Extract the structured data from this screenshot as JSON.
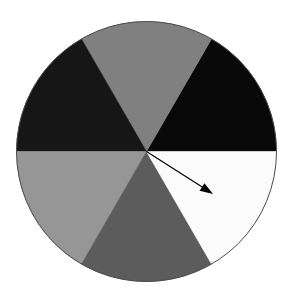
{
  "figure": {
    "background_color": "#ffffff",
    "width": 289,
    "height": 290
  },
  "wheel": {
    "name": "spinner-wheel",
    "center_x": 146.5,
    "center_y": 151.5,
    "radius": 130,
    "outline_color": "#4a4a4a",
    "outline_width": 1,
    "sector_count": 6,
    "sector_angle_degrees": 60
  },
  "chart_data": {
    "type": "pie",
    "categories": [
      "upper-right-black",
      "top-gray",
      "upper-left-dark",
      "lower-left-light-gray",
      "bottom-dark-gray",
      "lower-right-white"
    ],
    "values": [
      60,
      60,
      60,
      60,
      60,
      60
    ],
    "value_unit": "degrees",
    "colors": [
      "#090909",
      "#808080",
      "#161616",
      "#969696",
      "#5c5c5c",
      "#fbfbfb"
    ],
    "start_angle_degrees": 0,
    "legend": "none",
    "xlabel": "",
    "ylabel": ""
  },
  "sectors": [
    {
      "id": "sector-upper-right",
      "label": "upper-right-black",
      "color": "#090909",
      "start_angle": 0,
      "end_angle": 60
    },
    {
      "id": "sector-top",
      "label": "top-gray",
      "color": "#808080",
      "start_angle": 60,
      "end_angle": 120
    },
    {
      "id": "sector-upper-left",
      "label": "upper-left-dark",
      "color": "#161616",
      "start_angle": 120,
      "end_angle": 180
    },
    {
      "id": "sector-lower-left",
      "label": "lower-left-light-gray",
      "color": "#969696",
      "start_angle": 180,
      "end_angle": 240
    },
    {
      "id": "sector-bottom",
      "label": "bottom-dark-gray",
      "color": "#5c5c5c",
      "start_angle": 240,
      "end_angle": 300
    },
    {
      "id": "sector-lower-right",
      "label": "lower-right-white",
      "color": "#fbfbfb",
      "start_angle": 300,
      "end_angle": 360
    }
  ],
  "pointer": {
    "name": "pointer-arrow",
    "color": "#000000",
    "origin_x": 146.5,
    "origin_y": 151.5,
    "tip_x": 213,
    "tip_y": 194,
    "angle_degrees": -32.7,
    "length": 79,
    "points_at_sector": "lower-right-white",
    "shaft_width": 1.2,
    "head_length": 13,
    "head_width": 9
  }
}
